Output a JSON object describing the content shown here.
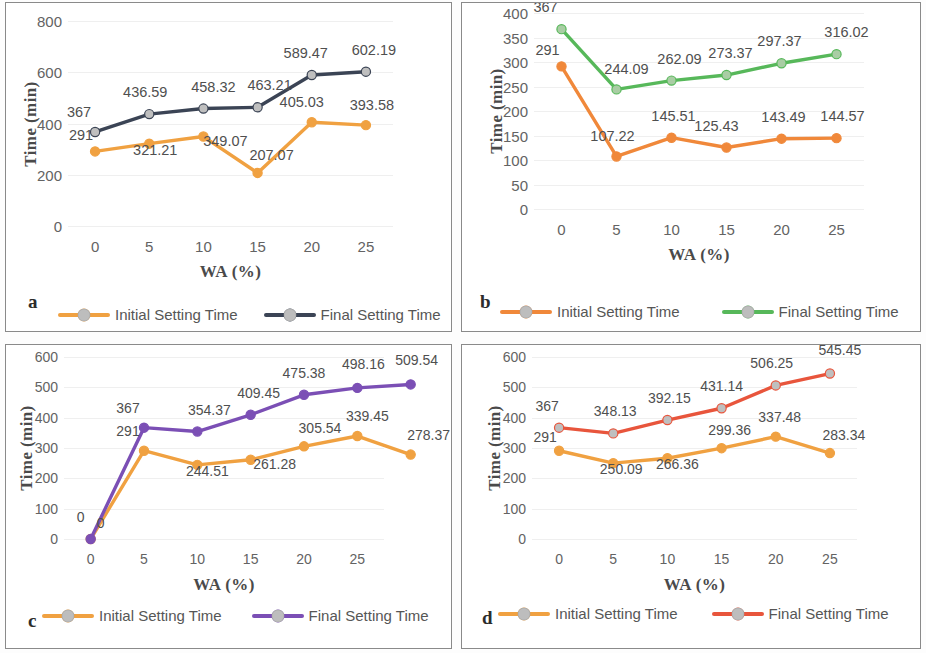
{
  "figure": {
    "panels": [
      {
        "letter": "a",
        "xlabel": "WA (%)",
        "ylabel": "Time (min)",
        "ylim": [
          0,
          800
        ],
        "yticks": [
          "0",
          "200",
          "400",
          "600",
          "800"
        ],
        "xticks": [
          "0",
          "5",
          "10",
          "15",
          "20",
          "25"
        ],
        "legend": [
          {
            "name": "Initial Setting Time",
            "color": "#F0A141"
          },
          {
            "name": "Final Setting Time",
            "color": "#3B4455"
          }
        ],
        "chart_data": {
          "type": "line",
          "title": "",
          "xlabel": "WA (%)",
          "ylabel": "Time (min)",
          "ylim": [
            0,
            800
          ],
          "grid": true,
          "legend_position": "bottom",
          "x": [
            0,
            5,
            10,
            15,
            20,
            25
          ],
          "series": [
            {
              "name": "Initial Setting Time",
              "color": "#F0A141",
              "marker_color": "#F0A141",
              "values": [
                291,
                321.21,
                349.07,
                207.07,
                405.03,
                393.58
              ],
              "labels": [
                "291",
                "321.21",
                "349.07",
                "207.07",
                "405.03",
                "393.58"
              ]
            },
            {
              "name": "Final Setting Time",
              "color": "#3B4455",
              "marker_color": "#BFBFBF",
              "values": [
                367,
                436.59,
                458.32,
                463.21,
                589.47,
                602.19
              ],
              "labels": [
                "367",
                "436.59",
                "458.32",
                "463.21",
                "589.47",
                "602.19"
              ]
            }
          ]
        }
      },
      {
        "letter": "b",
        "xlabel": "WA (%)",
        "ylabel": "Time (min)",
        "ylim": [
          0,
          400
        ],
        "yticks": [
          "0",
          "50",
          "100",
          "150",
          "200",
          "250",
          "300",
          "350",
          "400"
        ],
        "xticks": [
          "0",
          "5",
          "10",
          "15",
          "20",
          "25"
        ],
        "legend": [
          {
            "name": "Initial Setting Time",
            "color": "#F0883A"
          },
          {
            "name": "Final Setting Time",
            "color": "#57B85A"
          }
        ],
        "chart_data": {
          "type": "line",
          "title": "",
          "xlabel": "WA (%)",
          "ylabel": "Time (min)",
          "ylim": [
            0,
            400
          ],
          "grid": true,
          "legend_position": "bottom",
          "x": [
            0,
            5,
            10,
            15,
            20,
            25
          ],
          "series": [
            {
              "name": "Initial Setting Time",
              "color": "#F0883A",
              "marker_color": "#F0883A",
              "values": [
                291,
                107.22,
                145.51,
                125.43,
                143.49,
                144.57
              ],
              "labels": [
                "291",
                "107.22",
                "145.51",
                "125.43",
                "143.49",
                "144.57"
              ]
            },
            {
              "name": "Final Setting Time",
              "color": "#57B85A",
              "marker_color": "#A9CDA4",
              "values": [
                367,
                244.09,
                262.09,
                273.37,
                297.37,
                316.02
              ],
              "labels": [
                "367",
                "244.09",
                "262.09",
                "273.37",
                "297.37",
                "316.02"
              ]
            }
          ]
        }
      },
      {
        "letter": "c",
        "xlabel": "WA (%)",
        "ylabel": "Time (min)",
        "ylim": [
          0,
          600
        ],
        "yticks": [
          "0",
          "100",
          "200",
          "300",
          "400",
          "500",
          "600"
        ],
        "xticks": [
          "0",
          "5",
          "10",
          "15",
          "20",
          "25"
        ],
        "legend": [
          {
            "name": "Initial Setting Time",
            "color": "#F0A141"
          },
          {
            "name": "Final Setting Time",
            "color": "#7B4FB5"
          }
        ],
        "chart_data": {
          "type": "line",
          "title": "",
          "xlabel": "WA (%)",
          "ylabel": "Time (min)",
          "ylim": [
            0,
            600
          ],
          "grid": true,
          "legend_position": "bottom",
          "x": [
            0,
            5,
            10,
            15,
            20,
            25,
            30
          ],
          "series": [
            {
              "name": "Initial Setting Time",
              "color": "#F0A141",
              "marker_color": "#F0A141",
              "values": [
                0,
                291,
                244.51,
                261.28,
                305.54,
                339.45,
                278.37
              ],
              "labels": [
                "0",
                "291",
                "244.51",
                "261.28",
                "305.54",
                "339.45",
                "278.37"
              ]
            },
            {
              "name": "Final Setting Time",
              "color": "#7B4FB5",
              "marker_color": "#7B4FB5",
              "values": [
                0,
                367,
                354.37,
                409.45,
                475.38,
                498.16,
                509.54
              ],
              "labels": [
                "0",
                "367",
                "354.37",
                "409.45",
                "475.38",
                "498.16",
                "509.54"
              ]
            }
          ]
        }
      },
      {
        "letter": "d",
        "xlabel": "WA (%)",
        "ylabel": "Time (min)",
        "ylim": [
          0,
          600
        ],
        "yticks": [
          "0",
          "100",
          "200",
          "300",
          "400",
          "500",
          "600"
        ],
        "xticks": [
          "0",
          "5",
          "10",
          "15",
          "20",
          "25"
        ],
        "legend": [
          {
            "name": "Initial Setting Time",
            "color": "#F0A141"
          },
          {
            "name": "Final Setting Time",
            "color": "#E8553C"
          }
        ],
        "chart_data": {
          "type": "line",
          "title": "",
          "xlabel": "WA (%)",
          "ylabel": "Time (min)",
          "ylim": [
            0,
            600
          ],
          "grid": true,
          "legend_position": "bottom",
          "x": [
            0,
            5,
            10,
            15,
            20,
            25
          ],
          "series": [
            {
              "name": "Initial Setting Time",
              "color": "#F0A141",
              "marker_color": "#F0A141",
              "values": [
                291,
                250.09,
                266.36,
                299.36,
                337.48,
                283.34
              ],
              "labels": [
                "291",
                "250.09",
                "266.36",
                "299.36",
                "337.48",
                "283.34"
              ]
            },
            {
              "name": "Final Setting Time",
              "color": "#E8553C",
              "marker_color": "#BFBFBF",
              "values": [
                367,
                348.13,
                392.15,
                431.14,
                506.25,
                545.45
              ],
              "labels": [
                "367",
                "348.13",
                "392.15",
                "431.14",
                "506.25",
                "545.45"
              ]
            }
          ]
        }
      }
    ]
  }
}
